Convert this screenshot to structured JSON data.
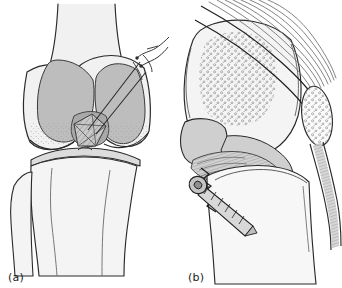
{
  "figure": {
    "type": "medical-line-illustration",
    "background_color": "#ffffff",
    "ink_color": "#1a1a1a",
    "panel_count": 2
  },
  "panels": [
    {
      "id": "a",
      "caption": "(a)",
      "view": "anteroposterior",
      "description": "Anterior view of knee showing suture fixation of avulsed intercondylar eminence fragment through transosseous tibial tunnels",
      "structures": [
        "femoral shaft",
        "medial femoral condyle",
        "lateral femoral condyle",
        "intercondylar notch",
        "avulsed bone fragment",
        "tibial plateau",
        "tibial shaft",
        "fibular head",
        "fibular shaft",
        "suture strands",
        "drill tunnels"
      ],
      "fill_colors": {
        "cortical_bone": "#f1f1f1",
        "condyle_shadow": "#bdbdbd",
        "notch_shadow": "#a9a9a9",
        "fragment": "#c9c9c9"
      }
    },
    {
      "id": "b",
      "caption": "(b)",
      "view": "lateral",
      "description": "Lateral view of knee showing cannulated screw fixation of the avulsed fragment with patella and extensor mechanism",
      "structures": [
        "distal femur",
        "cancellous bone stipple",
        "quadriceps tendon fibers",
        "patella",
        "patellar tendon",
        "femoral condyle",
        "tibial plateau",
        "tibial shaft",
        "avulsion fracture line",
        "fixation screw"
      ],
      "fill_colors": {
        "cortical_bone": "#f4f4f4",
        "soft_tissue": "#cfcfcf",
        "condyle_shadow": "#c2c2c2",
        "stipple": "#8e8e8e"
      }
    }
  ],
  "captions": {
    "panel_a": "(a)",
    "panel_b": "(b)"
  }
}
